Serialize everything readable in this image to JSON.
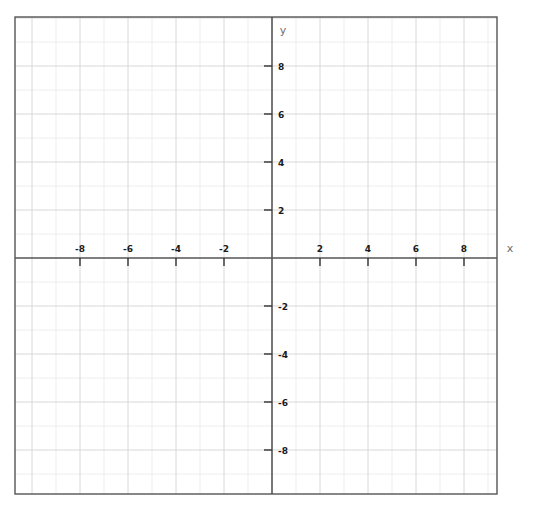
{
  "figure": {
    "title": "",
    "background_color": "#ffffff",
    "width": 538,
    "height": 507
  },
  "axes": {
    "x_axis_label": "x",
    "y_axis_label": "y",
    "axis_color": "#555555",
    "border_color": "#555555",
    "major_grid_color": "#d8d8d8",
    "minor_grid_color": "#ededed"
  },
  "chart_data": {
    "type": "scatter",
    "title": "",
    "subtitle": "",
    "xlabel": "x",
    "ylabel": "y",
    "xlim": [
      -10.7,
      9.4
    ],
    "ylim": [
      -9.8,
      10.0
    ],
    "x_ticks": [
      -8,
      -6,
      -4,
      -2,
      2,
      4,
      6,
      8
    ],
    "y_ticks": [
      -8,
      -6,
      -4,
      -2,
      2,
      4,
      6,
      8
    ],
    "x_tick_labels": [
      "-8",
      "-6",
      "-4",
      "-2",
      "2",
      "4",
      "6",
      "8"
    ],
    "y_tick_labels": [
      "-8",
      "-6",
      "-4",
      "-2",
      "2",
      "4",
      "6",
      "8"
    ],
    "x_major_step": 2,
    "y_major_step": 2,
    "x_minor_step": 1,
    "y_minor_step": 1,
    "grid": true,
    "minor_grid": true,
    "legend": null,
    "legend_position": "none",
    "series": [],
    "annotations": []
  },
  "geometry": {
    "origin_x": 272,
    "origin_y": 258,
    "unit_px": 24,
    "plot_left": 15,
    "plot_top": 17,
    "plot_right": 497,
    "plot_bottom": 494
  }
}
